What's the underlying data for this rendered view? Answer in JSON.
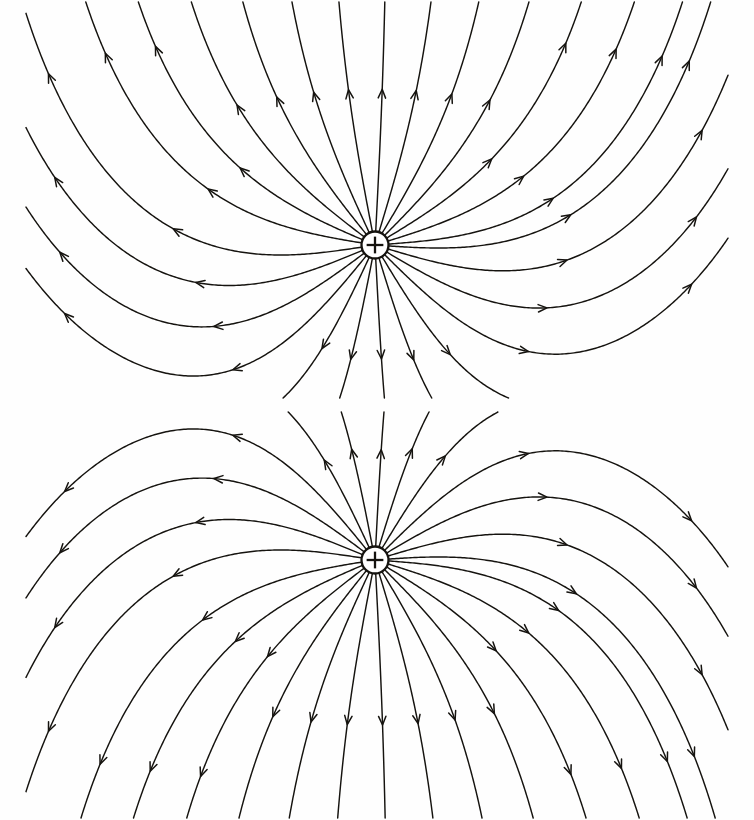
{
  "document": {
    "title": "Electric field lines of a positive point charge in a uniform external field",
    "background_color": "#fefefe",
    "line_color": "#15130f",
    "width": 754,
    "height": 820,
    "figure_count": 2
  },
  "figures": [
    {
      "id": "figure-top",
      "name": "positive-charge-in-upward-uniform-field",
      "caption": "",
      "charge": {
        "symbol": "+",
        "polarity": "positive",
        "label": "+",
        "cx": 375,
        "cy": 245,
        "radius": 13.5
      },
      "frame": {
        "x": 0,
        "y": 0,
        "width": 754,
        "height": 400
      },
      "uniform_field_direction": "up",
      "field_direction_degrees": 90,
      "flow_description": "Field lines radiate from the positive charge and are swept upward by the uniform field; lines emitted downward curve back and stream outward to the left and right edges.",
      "line_count": 26,
      "arrow_direction": "away-from-charge"
    },
    {
      "id": "figure-bottom",
      "name": "positive-charge-in-downward-uniform-field",
      "caption": "",
      "charge": {
        "symbol": "+",
        "polarity": "positive",
        "label": "+",
        "cx": 375,
        "cy": 150,
        "radius": 13.5
      },
      "frame": {
        "x": 0,
        "y": 0,
        "width": 754,
        "height": 410
      },
      "uniform_field_direction": "down",
      "field_direction_degrees": 270,
      "flow_description": "Mirror image of the upper figure: field lines radiate from the positive charge and are swept downward by the uniform field; lines emitted upward curve back and stream outward to the left and right edges.",
      "line_count": 26,
      "arrow_direction": "away-from-charge"
    }
  ],
  "chart_data": {
    "type": "line",
    "xlabel": "",
    "ylabel": "",
    "grid": false,
    "legend": false,
    "panels": [
      {
        "name": "top-panel",
        "uniform_field": "up",
        "charge_sign": "+",
        "charge_position": [
          375,
          245
        ],
        "description": "Streamlines of psi = E*y + k*cos(theta)",
        "stream_parameter_k": 1.0,
        "uniform_strength_E": 0.00345,
        "seed_angles_degrees": [
          4,
          17,
          31,
          45,
          59,
          73,
          87,
          101,
          115,
          129,
          143,
          157,
          171,
          189,
          203,
          217,
          231,
          245,
          259,
          273,
          287,
          301,
          315,
          329,
          343,
          356
        ]
      },
      {
        "name": "bottom-panel",
        "uniform_field": "down",
        "charge_sign": "+",
        "charge_position": [
          375,
          560
        ],
        "description": "Streamlines of psi = -E*y + k*cos(theta) (vertical mirror of top panel)",
        "stream_parameter_k": 1.0,
        "uniform_strength_E": 0.00345,
        "seed_angles_degrees": [
          4,
          17,
          31,
          45,
          59,
          73,
          87,
          101,
          115,
          129,
          143,
          157,
          171,
          189,
          203,
          217,
          231,
          245,
          259,
          273,
          287,
          301,
          315,
          329,
          343,
          356
        ]
      }
    ]
  }
}
